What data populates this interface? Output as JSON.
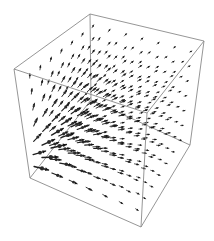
{
  "chart_data": {
    "type": "vector_field_3d",
    "title": "",
    "xlabel": "",
    "ylabel": "",
    "zlabel": "",
    "axes_visible": false,
    "grid": false,
    "legend": null,
    "box": {
      "visible": true,
      "edge_color": "#8a8a8a",
      "projected_corners": {
        "front_bottom_left": [
          30,
          178
        ],
        "front_bottom_right": [
          141,
          227
        ],
        "back_bottom_left": [
          91,
          100
        ],
        "back_bottom_right": [
          190,
          145
        ],
        "front_top_left": [
          14,
          69
        ],
        "front_top_right": [
          147,
          113
        ],
        "back_top_left": [
          90,
          14
        ],
        "back_top_right": [
          204,
          41
        ]
      }
    },
    "sampling": {
      "nu": 7,
      "nv": 7,
      "nw": 7,
      "range": [
        0,
        1
      ]
    },
    "field": {
      "description": "Radial outflow from a source near the left-front-bottom edge; vectors point upward on the left face and rightward along the bottom, magnitude decays with distance",
      "source_point": [
        -0.15,
        0.25,
        0.15
      ],
      "falloff_power": 1.2,
      "max_length_px": 16,
      "min_length_px": 2.5
    },
    "arrow_color": "#1e1e1e"
  }
}
